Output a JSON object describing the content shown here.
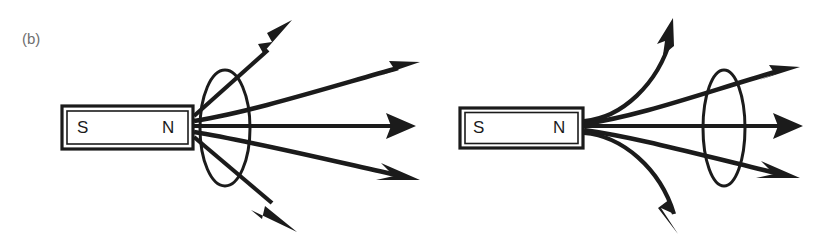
{
  "figure": {
    "panel_label": "(b)",
    "caption_present": false,
    "background_color": "#ffffff",
    "ink_color": "#1b1b1b",
    "label_color": "#6e6e6e",
    "width": 829,
    "height": 246
  },
  "diagrams": [
    {
      "id": "left-diagram",
      "name": "magnet-coil-close",
      "description": "Bar magnet with coil loop close to the north pole; field lines diverge and pass through the loop",
      "magnet": {
        "south_label": "S",
        "north_label": "N",
        "x": 62,
        "y": 106,
        "width": 131,
        "height": 43
      },
      "coil": {
        "name": "coil-loop-ellipse",
        "center_x": 225,
        "center_y": 128,
        "radius_x": 25,
        "radius_y": 58
      },
      "field_lines": [
        {
          "name": "field-line-up-outer",
          "direction": "up-right",
          "arrow_tip_x": 292,
          "arrow_tip_y": 20
        },
        {
          "name": "field-line-up-inner",
          "direction": "right-up",
          "arrow_tip_x": 420,
          "arrow_tip_y": 62
        },
        {
          "name": "field-line-axis",
          "direction": "right",
          "arrow_tip_x": 416,
          "arrow_tip_y": 126
        },
        {
          "name": "field-line-down-inner",
          "direction": "right-down",
          "arrow_tip_x": 420,
          "arrow_tip_y": 180
        },
        {
          "name": "field-line-down-outer",
          "direction": "down-right",
          "arrow_tip_x": 297,
          "arrow_tip_y": 232
        }
      ]
    },
    {
      "id": "right-diagram",
      "name": "magnet-coil-far",
      "description": "Bar magnet with coil loop farther from the north pole; fewer field lines thread the loop",
      "magnet": {
        "south_label": "S",
        "north_label": "N",
        "x": 460,
        "y": 108,
        "width": 123,
        "height": 40
      },
      "coil": {
        "name": "coil-loop-ellipse",
        "center_x": 724,
        "center_y": 128,
        "radius_x": 21,
        "radius_y": 58
      },
      "field_lines": [
        {
          "name": "field-line-up-outer",
          "direction": "curve-up-right",
          "arrow_tip_x": 673,
          "arrow_tip_y": 18
        },
        {
          "name": "field-line-up-inner",
          "direction": "right-up",
          "arrow_tip_x": 800,
          "arrow_tip_y": 67
        },
        {
          "name": "field-line-axis",
          "direction": "right",
          "arrow_tip_x": 803,
          "arrow_tip_y": 126
        },
        {
          "name": "field-line-down-inner",
          "direction": "right-down",
          "arrow_tip_x": 800,
          "arrow_tip_y": 178
        },
        {
          "name": "field-line-down-outer",
          "direction": "curve-down-right",
          "arrow_tip_x": 678,
          "arrow_tip_y": 234
        }
      ]
    }
  ]
}
